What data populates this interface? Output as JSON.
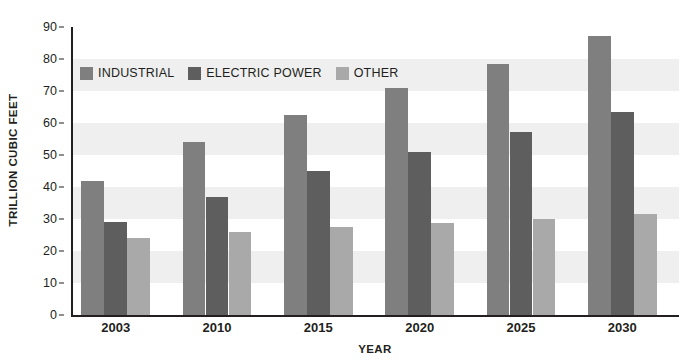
{
  "chart_data": {
    "type": "bar",
    "title": "",
    "subtitle": "",
    "xlabel": "YEAR",
    "ylabel": "TRILLION CUBIC FEET",
    "categories": [
      "2003",
      "2010",
      "2015",
      "2020",
      "2025",
      "2030"
    ],
    "series": [
      {
        "name": "INDUSTRIAL",
        "color": "#7f7f7f",
        "values": [
          42.0,
          54.2,
          62.5,
          71.0,
          78.5,
          87.2
        ]
      },
      {
        "name": "ELECTRIC POWER",
        "color": "#5e5e5e",
        "values": [
          29.2,
          37.0,
          45.0,
          51.0,
          57.2,
          63.5
        ]
      },
      {
        "name": "OTHER",
        "color": "#a9a9a9",
        "values": [
          24.0,
          26.0,
          27.5,
          28.7,
          30.0,
          31.5
        ]
      }
    ],
    "ylim": [
      0,
      90
    ],
    "ytick_step": 10,
    "yticks": [
      "0",
      "10",
      "20",
      "30",
      "40",
      "50",
      "60",
      "70",
      "80",
      "90"
    ],
    "grid": false,
    "banded_background": true,
    "band_color": "#efefef",
    "legend_position": "top-left-inside",
    "axis_color": "#231f20"
  },
  "legend": {
    "items": [
      {
        "label": "INDUSTRIAL"
      },
      {
        "label": "ELECTRIC POWER"
      },
      {
        "label": "OTHER"
      }
    ]
  },
  "axes": {
    "y_title": "TRILLION CUBIC FEET",
    "x_title": "YEAR"
  }
}
